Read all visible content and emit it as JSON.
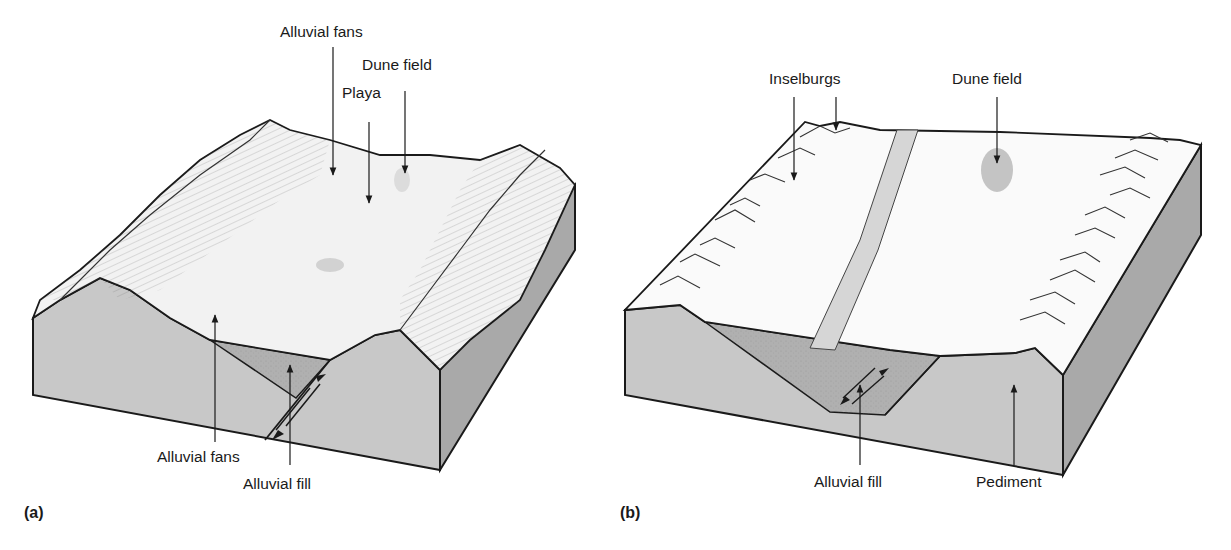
{
  "figure": {
    "panels": [
      {
        "tag": "(a)",
        "title": "Basin-and-range block diagram with playa",
        "labels": {
          "alluvial_fans_top": "Alluvial fans",
          "dune_field": "Dune field",
          "playa": "Playa",
          "alluvial_fans_bottom": "Alluvial fans",
          "alluvial_fill": "Alluvial fill"
        }
      },
      {
        "tag": "(b)",
        "title": "Eroded basin with inselbergs and pediment",
        "labels": {
          "inselburgs": "Inselburgs",
          "dune_field": "Dune field",
          "alluvial_fill": "Alluvial fill",
          "pediment": "Pediment"
        }
      }
    ],
    "colors": {
      "surface": "#f2f2f2",
      "front_face": "#c8c8c8",
      "side_face": "#a9a9a9",
      "fill": "#b4b4b4",
      "river": "#d6d6d6",
      "dune": "#c4c4c4",
      "outline": "#1a1a1a"
    }
  }
}
